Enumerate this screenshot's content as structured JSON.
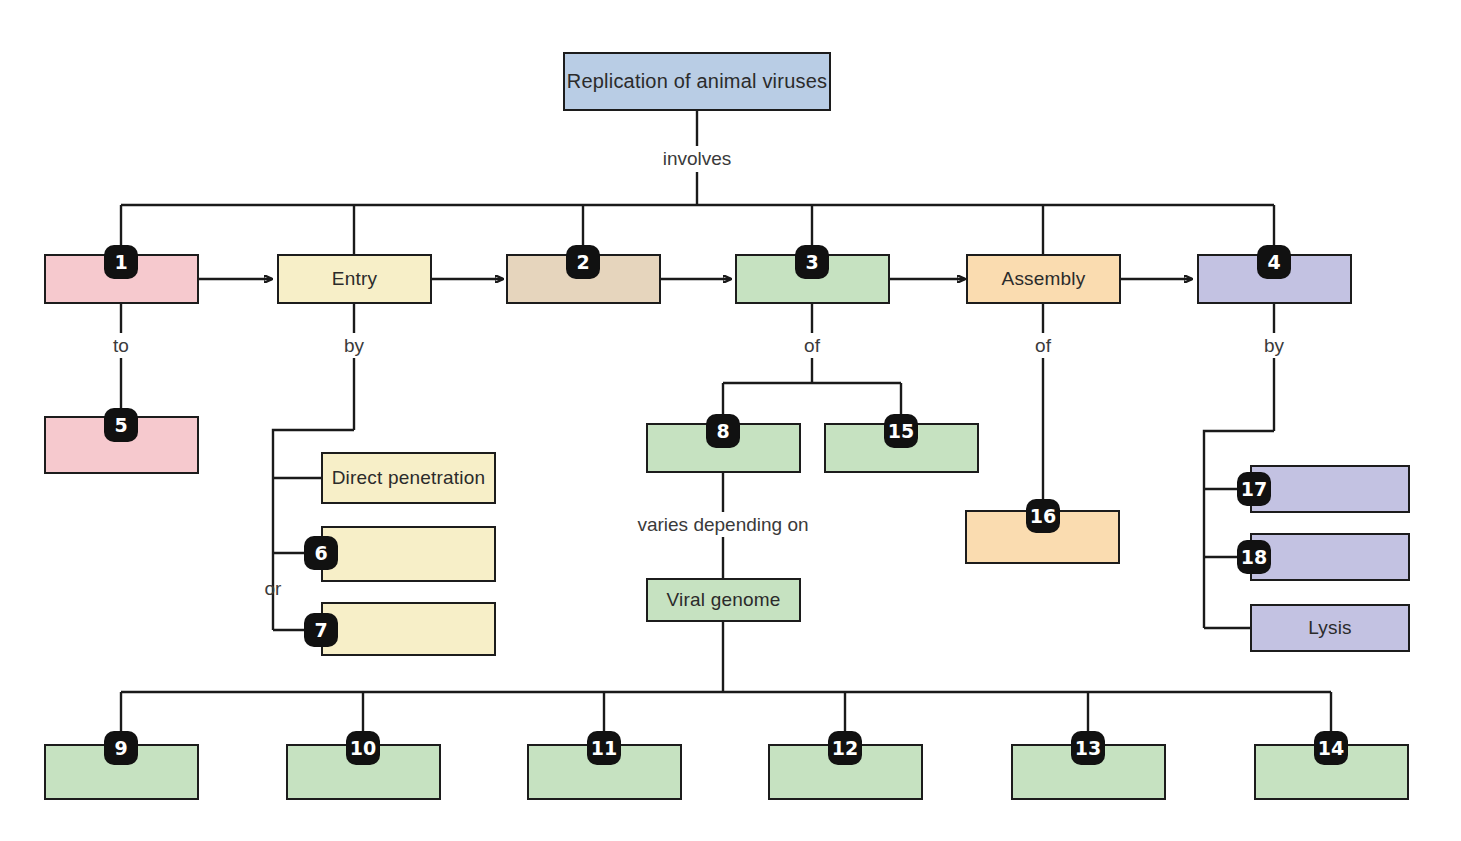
{
  "diagram": {
    "title": "Replication of animal viruses",
    "root": {
      "label": "Replication of animal viruses",
      "color": "#b9cde5"
    },
    "linkers": {
      "involves": "involves",
      "to": "to",
      "by_entry": "by",
      "of_three": "of",
      "of_assembly": "of",
      "by_release": "by",
      "or": "or",
      "varies": "varies depending on"
    },
    "palette": {
      "pink": "#f6c9ce",
      "cream": "#f7efc8",
      "tan": "#e6d5bd",
      "green": "#c6e2c1",
      "orange": "#fadcb0",
      "purple": "#c3c2e2",
      "blue": "#b9cde5",
      "stroke": "#1c1c1c"
    },
    "main_row": [
      {
        "id": "m1",
        "label": "",
        "number": "1",
        "color": "#f6c9ce"
      },
      {
        "id": "m2",
        "label": "Entry",
        "number": "",
        "color": "#f7efc8"
      },
      {
        "id": "m3",
        "label": "",
        "number": "2",
        "color": "#e6d5bd"
      },
      {
        "id": "m4",
        "label": "",
        "number": "3",
        "color": "#c6e2c1"
      },
      {
        "id": "m5",
        "label": "Assembly",
        "number": "",
        "color": "#fadcb0"
      },
      {
        "id": "m6",
        "label": "",
        "number": "4",
        "color": "#c3c2e2"
      }
    ],
    "attachment_branch": [
      {
        "id": "b5",
        "label": "",
        "number": "5",
        "color": "#f6c9ce"
      }
    ],
    "entry_branch": [
      {
        "id": "e1",
        "label": "Direct penetration",
        "number": "",
        "color": "#f7efc8"
      },
      {
        "id": "e2",
        "label": "",
        "number": "6",
        "color": "#f7efc8"
      },
      {
        "id": "e3",
        "label": "",
        "number": "7",
        "color": "#f7efc8"
      }
    ],
    "synthesis_branch": [
      {
        "id": "s8",
        "label": "",
        "number": "8",
        "color": "#c6e2c1"
      },
      {
        "id": "s15",
        "label": "",
        "number": "15",
        "color": "#c6e2c1"
      }
    ],
    "genome": {
      "id": "vg",
      "label": "Viral genome",
      "number": "",
      "color": "#c6e2c1"
    },
    "assembly_branch": [
      {
        "id": "a16",
        "label": "",
        "number": "16",
        "color": "#fadcb0"
      }
    ],
    "release_branch": [
      {
        "id": "r17",
        "label": "",
        "number": "17",
        "color": "#c3c2e2"
      },
      {
        "id": "r18",
        "label": "",
        "number": "18",
        "color": "#c3c2e2"
      },
      {
        "id": "rL",
        "label": "Lysis",
        "number": "",
        "color": "#c3c2e2"
      }
    ],
    "genome_types": [
      {
        "id": "g9",
        "label": "",
        "number": "9",
        "color": "#c6e2c1"
      },
      {
        "id": "g10",
        "label": "",
        "number": "10",
        "color": "#c6e2c1"
      },
      {
        "id": "g11",
        "label": "",
        "number": "11",
        "color": "#c6e2c1"
      },
      {
        "id": "g12",
        "label": "",
        "number": "12",
        "color": "#c6e2c1"
      },
      {
        "id": "g13",
        "label": "",
        "number": "13",
        "color": "#c6e2c1"
      },
      {
        "id": "g14",
        "label": "",
        "number": "14",
        "color": "#c6e2c1"
      }
    ]
  }
}
